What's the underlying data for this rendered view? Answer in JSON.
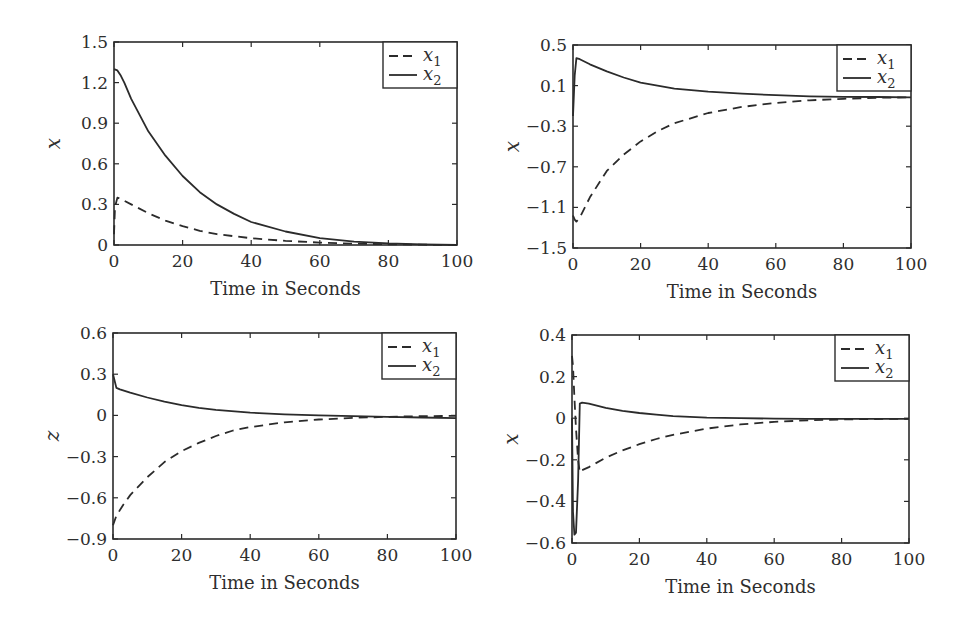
{
  "figure": {
    "width": 959,
    "height": 633,
    "line_color": "#2b2b2b"
  },
  "chart_data": [
    {
      "type": "line",
      "title": "",
      "xlabel": "Time in Seconds",
      "ylabel": "x",
      "xlim": [
        0,
        100
      ],
      "ylim": [
        0,
        1.5
      ],
      "xticks": [
        0,
        20,
        40,
        60,
        80,
        100
      ],
      "yticks": [
        0,
        0.3,
        0.6,
        0.9,
        1.2,
        1.5
      ],
      "ytick_labels": [
        "0",
        "0.3",
        "0.6",
        "0.9",
        "1.2",
        "1.5"
      ],
      "grid": false,
      "legend_position": "upper right",
      "frame": {
        "left": 114,
        "right": 457,
        "top": 42,
        "bottom": 245
      },
      "series": [
        {
          "name": "x1",
          "style": "dashed",
          "x": [
            0,
            0.3,
            1,
            2,
            5,
            10,
            15,
            20,
            25,
            30,
            40,
            50,
            60,
            70,
            80,
            90,
            100
          ],
          "y": [
            0.08,
            0.28,
            0.35,
            0.34,
            0.3,
            0.235,
            0.18,
            0.14,
            0.105,
            0.08,
            0.05,
            0.03,
            0.018,
            0.01,
            0.005,
            0.002,
            0.0
          ]
        },
        {
          "name": "x2",
          "style": "solid",
          "x": [
            0,
            1,
            2,
            3,
            5,
            10,
            15,
            20,
            25,
            30,
            35,
            40,
            50,
            60,
            70,
            80,
            90,
            100
          ],
          "y": [
            1.3,
            1.29,
            1.25,
            1.2,
            1.08,
            0.84,
            0.66,
            0.51,
            0.39,
            0.3,
            0.23,
            0.17,
            0.1,
            0.05,
            0.025,
            0.012,
            0.005,
            0.0
          ]
        }
      ]
    },
    {
      "type": "line",
      "title": "",
      "xlabel": "Time in Seconds",
      "ylabel": "x",
      "xlim": [
        0,
        100
      ],
      "ylim": [
        -1.5,
        0.5
      ],
      "xticks": [
        0,
        20,
        40,
        60,
        80,
        100
      ],
      "yticks": [
        -1.5,
        -1.1,
        -0.7,
        -0.3,
        0.1,
        0.5
      ],
      "ytick_labels": [
        "−1.5",
        "−1.1",
        "−0.7",
        "−0.3",
        "0.1",
        "0.5"
      ],
      "grid": false,
      "legend_position": "upper right",
      "frame": {
        "left": 573,
        "right": 911,
        "top": 45,
        "bottom": 248
      },
      "series": [
        {
          "name": "x1",
          "style": "dashed",
          "x": [
            0,
            0.5,
            1,
            2,
            5,
            10,
            15,
            20,
            25,
            30,
            40,
            50,
            60,
            70,
            80,
            90,
            100
          ],
          "y": [
            -1.18,
            -1.22,
            -1.24,
            -1.2,
            -1.0,
            -0.74,
            -0.58,
            -0.45,
            -0.35,
            -0.27,
            -0.17,
            -0.11,
            -0.07,
            -0.045,
            -0.03,
            -0.02,
            -0.015
          ]
        },
        {
          "name": "x2",
          "style": "solid",
          "x": [
            0,
            0.5,
            1,
            2,
            5,
            10,
            15,
            20,
            25,
            30,
            40,
            50,
            60,
            70,
            80,
            90,
            100
          ],
          "y": [
            -0.2,
            0.2,
            0.37,
            0.36,
            0.31,
            0.24,
            0.18,
            0.13,
            0.1,
            0.07,
            0.04,
            0.02,
            0.005,
            -0.005,
            -0.01,
            -0.012,
            -0.015
          ]
        }
      ]
    },
    {
      "type": "line",
      "title": "",
      "xlabel": "Time in Seconds",
      "ylabel": "z",
      "xlim": [
        0,
        100
      ],
      "ylim": [
        -0.9,
        0.6
      ],
      "xticks": [
        0,
        20,
        40,
        60,
        80,
        100
      ],
      "yticks": [
        -0.9,
        -0.6,
        -0.3,
        0,
        0.3,
        0.6
      ],
      "ytick_labels": [
        "−0.9",
        "−0.6",
        "−0.3",
        "0",
        "0.3",
        "0.6"
      ],
      "grid": false,
      "legend_position": "upper right",
      "frame": {
        "left": 113,
        "right": 456,
        "top": 333,
        "bottom": 539
      },
      "series": [
        {
          "name": "x1",
          "style": "dashed",
          "x": [
            0,
            1,
            3,
            5,
            10,
            15,
            20,
            25,
            30,
            35,
            40,
            50,
            60,
            70,
            80,
            90,
            100
          ],
          "y": [
            -0.8,
            -0.73,
            -0.65,
            -0.58,
            -0.45,
            -0.34,
            -0.26,
            -0.2,
            -0.15,
            -0.11,
            -0.085,
            -0.05,
            -0.03,
            -0.018,
            -0.01,
            -0.006,
            -0.004
          ]
        },
        {
          "name": "x2",
          "style": "solid",
          "x": [
            0,
            0.3,
            1,
            2,
            5,
            10,
            15,
            20,
            25,
            30,
            40,
            50,
            60,
            70,
            80,
            90,
            100
          ],
          "y": [
            0.3,
            0.27,
            0.2,
            0.19,
            0.165,
            0.13,
            0.1,
            0.075,
            0.055,
            0.04,
            0.02,
            0.008,
            0.0,
            -0.005,
            -0.01,
            -0.015,
            -0.02
          ]
        }
      ]
    },
    {
      "type": "line",
      "title": "",
      "xlabel": "Time in Seconds",
      "ylabel": "x",
      "xlim": [
        0,
        100
      ],
      "ylim": [
        -0.6,
        0.4
      ],
      "xticks": [
        0,
        20,
        40,
        60,
        80,
        100
      ],
      "yticks": [
        -0.6,
        -0.4,
        -0.2,
        0,
        0.2,
        0.4
      ],
      "ytick_labels": [
        "−0.6",
        "−0.4",
        "−0.2",
        "0",
        "0.2",
        "0.4"
      ],
      "grid": false,
      "legend_position": "upper right",
      "frame": {
        "left": 572,
        "right": 909,
        "top": 335,
        "bottom": 543
      },
      "series": [
        {
          "name": "x1",
          "style": "dashed",
          "x": [
            0,
            0.3,
            0.7,
            1.2,
            1.8,
            2.3,
            3,
            5,
            10,
            15,
            20,
            25,
            30,
            40,
            50,
            60,
            70,
            80,
            90,
            100
          ],
          "y": [
            0.3,
            0.25,
            0.1,
            -0.05,
            -0.2,
            -0.26,
            -0.25,
            -0.235,
            -0.19,
            -0.155,
            -0.125,
            -0.1,
            -0.08,
            -0.05,
            -0.03,
            -0.018,
            -0.01,
            -0.006,
            -0.004,
            -0.003
          ]
        },
        {
          "name": "x2",
          "style": "solid",
          "x": [
            0,
            0.3,
            0.7,
            1.2,
            1.8,
            2.3,
            3,
            5,
            10,
            15,
            20,
            25,
            30,
            40,
            50,
            60,
            70,
            80,
            90,
            100
          ],
          "y": [
            0.0,
            -0.45,
            -0.56,
            -0.55,
            -0.3,
            0.07,
            0.075,
            0.07,
            0.05,
            0.035,
            0.025,
            0.017,
            0.01,
            0.003,
            0.0,
            -0.002,
            -0.003,
            -0.003,
            -0.003,
            -0.003
          ]
        }
      ]
    }
  ],
  "legend": {
    "entries": [
      {
        "symbol": "x",
        "subscript": "1",
        "style": "dashed"
      },
      {
        "symbol": "x",
        "subscript": "2",
        "style": "solid"
      }
    ]
  }
}
